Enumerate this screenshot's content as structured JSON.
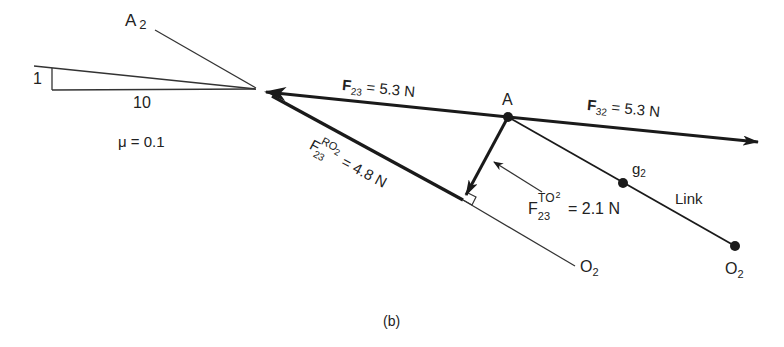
{
  "figure": {
    "caption": "(b)",
    "slope": {
      "rise": "1",
      "run": "10",
      "friction": "μ = 0.1"
    },
    "labels": {
      "a2": {
        "main": "A",
        "sub": "2"
      },
      "point_a": "A",
      "g2": {
        "main": "g",
        "sub": "2"
      },
      "link": "Link",
      "o2_right": {
        "main": "O",
        "sub": "2"
      },
      "o2_lower": {
        "main": "O",
        "sub": "2"
      }
    },
    "forces": {
      "f23": {
        "main": "F",
        "sub": "23",
        "value": " = 5.3 N"
      },
      "f32": {
        "main": "F",
        "sub": "32",
        "value": " = 5.3 N"
      },
      "f23_ro2": {
        "main": "F",
        "sub": "23",
        "sup": "RO",
        "sup_sub": "2",
        "value": " = 4.8 N"
      },
      "f23_to2": {
        "main": "F",
        "sub": "23",
        "sup": "TO",
        "sup_sub": "2",
        "value": " = 2.1 N"
      }
    }
  }
}
